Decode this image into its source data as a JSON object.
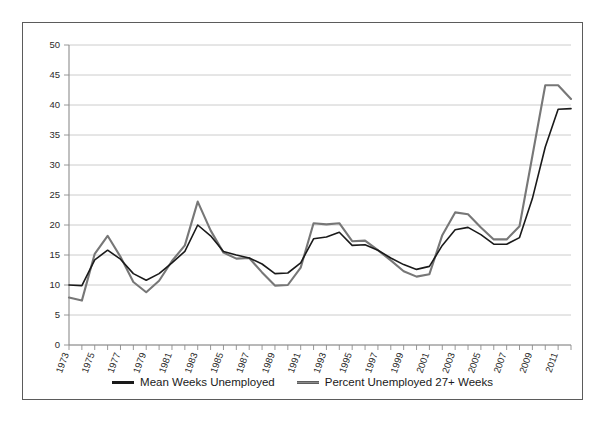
{
  "chart_data": {
    "type": "line",
    "title": "",
    "xlabel": "",
    "ylabel": "",
    "ylim": [
      0,
      50
    ],
    "ytick_step": 5,
    "yticks": [
      0,
      5,
      10,
      15,
      20,
      25,
      30,
      35,
      40,
      45,
      50
    ],
    "grid": true,
    "legend_position": "bottom",
    "xtick_labels": [
      "1973",
      "1975",
      "1977",
      "1979",
      "1981",
      "1983",
      "1985",
      "1987",
      "1989",
      "1991",
      "1993",
      "1995",
      "1997",
      "1999",
      "2001",
      "2003",
      "2005",
      "2007",
      "2009",
      "2011"
    ],
    "x": [
      1973,
      1974,
      1975,
      1976,
      1977,
      1978,
      1979,
      1980,
      1981,
      1982,
      1983,
      1984,
      1985,
      1986,
      1987,
      1988,
      1989,
      1990,
      1991,
      1992,
      1993,
      1994,
      1995,
      1996,
      1997,
      1998,
      1999,
      2000,
      2001,
      2002,
      2003,
      2004,
      2005,
      2006,
      2007,
      2008,
      2009,
      2010,
      2011,
      2012
    ],
    "series": [
      {
        "name": "Mean Weeks Unemployed",
        "color": "#1a1a1a",
        "values": [
          10.0,
          9.9,
          14.2,
          15.8,
          14.3,
          11.9,
          10.8,
          11.9,
          13.7,
          15.6,
          20.0,
          18.2,
          15.6,
          15.0,
          14.5,
          13.5,
          11.9,
          12.0,
          13.7,
          17.7,
          18.0,
          18.8,
          16.6,
          16.7,
          15.8,
          14.5,
          13.4,
          12.6,
          13.1,
          16.6,
          19.2,
          19.6,
          18.4,
          16.8,
          16.8,
          17.9,
          24.4,
          33.0,
          39.3,
          39.4
        ]
      },
      {
        "name": "Percent Unemployed 27+ Weeks",
        "color": "#777777",
        "values": [
          7.9,
          7.4,
          15.2,
          18.2,
          14.7,
          10.5,
          8.8,
          10.7,
          14.0,
          16.6,
          23.9,
          19.1,
          15.4,
          14.4,
          14.5,
          12.1,
          9.9,
          10.0,
          12.9,
          20.3,
          20.1,
          20.3,
          17.3,
          17.4,
          15.8,
          14.1,
          12.3,
          11.4,
          11.8,
          18.3,
          22.1,
          21.8,
          19.6,
          17.6,
          17.6,
          19.8,
          31.5,
          43.3,
          43.3,
          41.0
        ]
      }
    ]
  },
  "legend": {
    "items": [
      {
        "label": "Mean Weeks Unemployed"
      },
      {
        "label": "Percent Unemployed 27+ Weeks"
      }
    ]
  }
}
